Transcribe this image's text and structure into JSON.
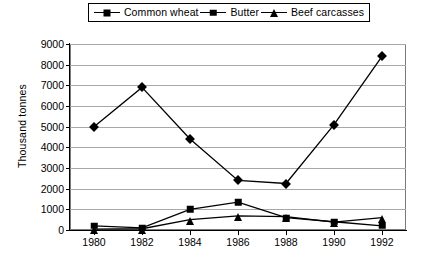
{
  "chart_data": {
    "type": "line",
    "title": "",
    "xlabel": "",
    "ylabel": "Thousand tonnes",
    "categories": [
      1980,
      1982,
      1984,
      1986,
      1988,
      1990,
      1992
    ],
    "xtick_labels": [
      "1980",
      "1982",
      "1984",
      "1986",
      "1988",
      "1990",
      "1992"
    ],
    "ytick_labels": [
      "0",
      "1000",
      "2000",
      "3000",
      "4000",
      "5000",
      "6000",
      "7000",
      "8000",
      "9000"
    ],
    "ylim": [
      0,
      9000
    ],
    "ytick_step": 1000,
    "xlim": [
      1979,
      1993
    ],
    "grid": "horizontal",
    "legend_position": "top-center",
    "series": [
      {
        "name": "Common wheat",
        "marker": "diamond",
        "color": "#000000",
        "values": [
          5000,
          6900,
          4400,
          2400,
          2250,
          5100,
          8400
        ]
      },
      {
        "name": "Butter",
        "marker": "square",
        "color": "#000000",
        "values": [
          200,
          100,
          1000,
          1350,
          600,
          400,
          200
        ]
      },
      {
        "name": "Beef carcasses",
        "marker": "triangle",
        "color": "#000000",
        "values": [
          40,
          60,
          500,
          680,
          650,
          380,
          600
        ]
      }
    ]
  },
  "legend": {
    "items": [
      {
        "label": "Common wheat",
        "marker": "diamond"
      },
      {
        "label": "Butter",
        "marker": "square"
      },
      {
        "label": "Beef carcasses",
        "marker": "triangle"
      }
    ]
  },
  "axis": {
    "y_title": "Thousand tonnes"
  },
  "caption": {
    "text": ""
  }
}
